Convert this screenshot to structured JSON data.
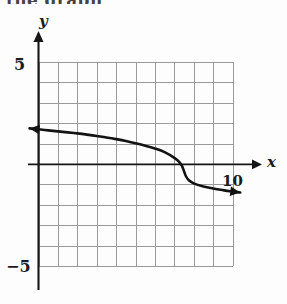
{
  "figure": {
    "top_cut_text": "the graph",
    "axis_labels": {
      "x": "x",
      "y": "y"
    },
    "tick_labels": {
      "y_top": "5",
      "y_bottom": "−5"
    },
    "annotations": [
      {
        "text": "10",
        "x": 10,
        "y": -0.9
      }
    ],
    "colors": {
      "grid": "#9a9a9a",
      "axis": "#161616",
      "curve": "#131313",
      "background": "#ffffff",
      "text": "#1c1c1c"
    }
  },
  "chart_data": {
    "type": "line",
    "title": "",
    "subtitle": "",
    "xlabel": "x",
    "ylabel": "y",
    "xlim": [
      0,
      10
    ],
    "ylim": [
      -5,
      5
    ],
    "grid": true,
    "grid_step": 1,
    "legend": "none",
    "axis_tick_labels": {
      "y": [
        5,
        -5
      ]
    },
    "annotations": [
      {
        "text": "10",
        "x": 10,
        "y": -0.9
      }
    ],
    "series": [
      {
        "name": "f",
        "style": "solid",
        "linewidth": 2.6,
        "arrow_start": true,
        "arrow_end": true,
        "x": [
          0.0,
          0.5,
          1.0,
          1.5,
          2.0,
          2.5,
          3.0,
          3.5,
          4.0,
          4.5,
          5.0,
          5.5,
          6.0,
          6.5,
          7.0,
          7.25,
          7.4,
          7.5,
          7.6,
          7.75,
          8.0,
          8.5,
          9.0,
          9.5,
          10.0,
          10.4
        ],
        "y": [
          1.7,
          1.65,
          1.6,
          1.55,
          1.5,
          1.44,
          1.37,
          1.3,
          1.22,
          1.13,
          1.02,
          0.9,
          0.76,
          0.58,
          0.3,
          0.1,
          -0.1,
          -0.35,
          -0.6,
          -0.8,
          -0.95,
          -1.1,
          -1.2,
          -1.28,
          -1.35,
          -1.4
        ]
      }
    ]
  }
}
